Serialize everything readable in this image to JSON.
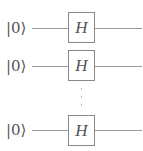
{
  "diagram": {
    "type": "quantum-circuit",
    "qubits": [
      {
        "input": "|0⟩",
        "gate": "H"
      },
      {
        "input": "|0⟩",
        "gate": "H"
      },
      {
        "input": "|0⟩",
        "gate": "H"
      }
    ],
    "ellipsis": "⋮"
  }
}
